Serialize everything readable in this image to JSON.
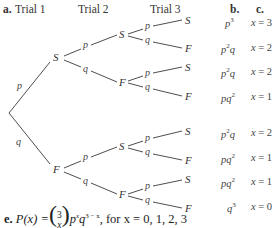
{
  "headers": {
    "part_a": "a.",
    "trial1": "Trial 1",
    "trial2": "Trial 2",
    "trial3": "Trial 3",
    "part_b": "b.",
    "part_c": "c."
  },
  "tree": {
    "trial1": [
      {
        "node": "S",
        "branch": "p"
      },
      {
        "node": "F",
        "branch": "q"
      }
    ],
    "trial2": [
      {
        "node": "S",
        "branch": "p"
      },
      {
        "node": "F",
        "branch": "q"
      },
      {
        "node": "S",
        "branch": "p"
      },
      {
        "node": "F",
        "branch": "q"
      }
    ],
    "trial3": [
      {
        "node": "S",
        "branch": "p"
      },
      {
        "node": "F",
        "branch": "q"
      },
      {
        "node": "S",
        "branch": "p"
      },
      {
        "node": "F",
        "branch": "q"
      },
      {
        "node": "S",
        "branch": "p"
      },
      {
        "node": "F",
        "branch": "q"
      },
      {
        "node": "S",
        "branch": "p"
      },
      {
        "node": "F",
        "branch": "q"
      }
    ]
  },
  "outcomes": [
    {
      "prob_base": "p",
      "prob_exp": "3",
      "prob_tail": "",
      "x_label": "x",
      "x_value": "= 3"
    },
    {
      "prob_base": "p",
      "prob_exp": "2",
      "prob_tail": "q",
      "x_label": "x",
      "x_value": "= 2"
    },
    {
      "prob_base": "p",
      "prob_exp": "2",
      "prob_tail": "q",
      "x_label": "x",
      "x_value": "= 2"
    },
    {
      "prob_base": "pq",
      "prob_exp": "2",
      "prob_tail": "",
      "x_label": "x",
      "x_value": "= 1"
    },
    {
      "prob_base": "p",
      "prob_exp": "2",
      "prob_tail": "q",
      "x_label": "x",
      "x_value": "= 2"
    },
    {
      "prob_base": "pq",
      "prob_exp": "2",
      "prob_tail": "",
      "x_label": "x",
      "x_value": "= 1"
    },
    {
      "prob_base": "pq",
      "prob_exp": "2",
      "prob_tail": "",
      "x_label": "x",
      "x_value": "= 1"
    },
    {
      "prob_base": "q",
      "prob_exp": "3",
      "prob_tail": "",
      "x_label": "x",
      "x_value": "= 0"
    }
  ],
  "formula": {
    "part": "e.",
    "lhs": "P(x) =",
    "binom_top": "3",
    "binom_bottom": "x",
    "p": "p",
    "p_exp": "x",
    "q": "q",
    "q_exp": "3 − x",
    "suffix": ", for x = 0, 1, 2, 3"
  }
}
